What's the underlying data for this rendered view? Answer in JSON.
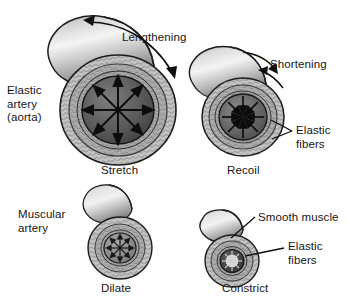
{
  "figure": {
    "background_color": "#ffffff",
    "style": "grayscale anatomical illustration",
    "labels": {
      "elastic_artery": "Elastic\narterya\n(aorta)",
      "elastic_artery_line1": "Elastic",
      "elastic_artery_line2": "artery",
      "elastic_artery_line3": "(aorta)",
      "muscular_artery_line1": "Muscular",
      "muscular_artery_line2": "artery",
      "lengthening": "Lengthening",
      "shortening": "Shortening",
      "elastic_fibers_right_line1": "Elastic",
      "elastic_fibers_right_line2": "fibers",
      "smooth_muscle": "Smooth muscle",
      "elastic_fibers_bottom_line1": "Elastic",
      "elastic_fibers_bottom_line2": "fibers",
      "stretch": "Stretch",
      "recoil": "Recoil",
      "dilate": "Dilate",
      "constrict": "Constrict"
    },
    "vessels": [
      {
        "id": "elastic-artery-stretch",
        "name": "Elastic artery stretched",
        "caption": "Stretch",
        "arrows": "eight outward radiating arrows in lumen",
        "arrow_direction": "outward",
        "size": "large"
      },
      {
        "id": "elastic-artery-recoil",
        "name": "Elastic artery recoiled",
        "caption": "Recoil",
        "arrows": "eight inward pointing arrows in lumen",
        "arrow_direction": "inward",
        "size": "medium"
      },
      {
        "id": "muscular-artery-dilate",
        "name": "Muscular artery dilated",
        "caption": "Dilate",
        "arrows": "short outward arrows in lumen",
        "arrow_direction": "outward",
        "size": "small"
      },
      {
        "id": "muscular-artery-constrict",
        "name": "Muscular artery constricted",
        "caption": "Constrict",
        "arrows": "short inward arrows in narrow lumen",
        "arrow_direction": "inward",
        "size": "small"
      }
    ],
    "motion_arrows": [
      {
        "id": "lengthening-arrow",
        "label": "Lengthening",
        "type": "double-headed curved arrow"
      },
      {
        "id": "shortening-arrow",
        "label": "Shortening",
        "type": "two converging curved arrows"
      }
    ],
    "leaders": [
      {
        "id": "elastic-fibers-right-leader",
        "target": "elastic artery recoil wall",
        "label": "Elastic fibers",
        "type": "v-bracket"
      },
      {
        "id": "smooth-muscle-leader",
        "target": "muscular artery constrict outer wall",
        "label": "Smooth muscle",
        "type": "diagonal line"
      },
      {
        "id": "elastic-fibers-bottom-leader",
        "target": "muscular artery constrict inner ring",
        "label": "Elastic fibers",
        "type": "horizontal line"
      }
    ],
    "colors": {
      "outline": "#1a1a1a",
      "wall_light": "#d8d8d8",
      "wall_mid": "#9a9a9a",
      "wall_dark": "#5a5a5a",
      "lumen_dark": "#4e4e4e",
      "lumen_light": "#8d8d8d",
      "tube_highlight": "#f2f2f2",
      "tube_shadow": "#707070"
    }
  }
}
